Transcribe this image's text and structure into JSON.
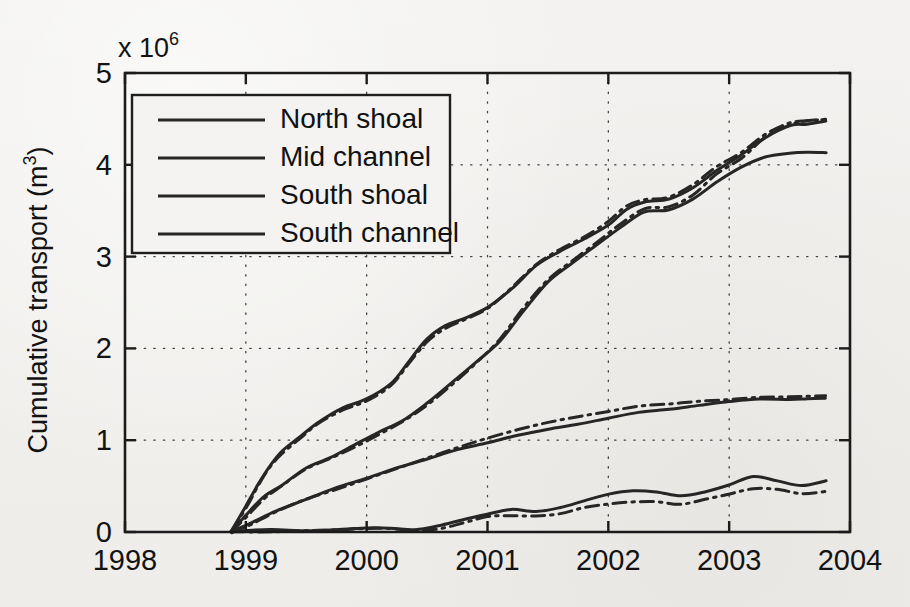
{
  "figure": {
    "kind": "scanned-line-plot",
    "background_color": "#f2f1ef",
    "ink_color": "#262626"
  },
  "chart_data": {
    "type": "line",
    "title": "",
    "xlabel": "",
    "ylabel": "Cumulative transport (m3)",
    "ylabel_base": "Cumulative transport (m",
    "ylabel_sup": "3",
    "ylabel_close": ")",
    "y_exponent_prefix": "x 10",
    "y_exponent": "6",
    "y_scale_note": "values in units of 1e6 m^3",
    "xlim": [
      1998,
      2004
    ],
    "ylim": [
      0,
      5
    ],
    "xticks": [
      1998,
      1999,
      2000,
      2001,
      2002,
      2003,
      2004
    ],
    "xticklabels": [
      "1998",
      "1999",
      "2000",
      "2001",
      "2002",
      "2003",
      "2004"
    ],
    "yticks": [
      0,
      1,
      2,
      3,
      4,
      5
    ],
    "yticklabels": [
      "0",
      "1",
      "2",
      "3",
      "4",
      "5"
    ],
    "grid": true,
    "grid_style": "dotted",
    "legend_position": "upper-left",
    "legend_entries": [
      "North shoal",
      "Mid channel",
      "South shoal",
      "South channel"
    ],
    "series": [
      {
        "name": "North shoal",
        "style": "solid",
        "x": [
          1998.88,
          1999.0,
          1999.1,
          1999.2,
          1999.3,
          1999.45,
          1999.6,
          1999.8,
          2000.0,
          2000.2,
          2000.35,
          2000.5,
          2000.65,
          2000.8,
          2001.0,
          2001.2,
          2001.4,
          2001.6,
          2001.8,
          2002.0,
          2002.15,
          2002.3,
          2002.5,
          2002.7,
          2002.9,
          2003.1,
          2003.3,
          2003.5,
          2003.65,
          2003.8
        ],
        "y": [
          0.0,
          0.28,
          0.52,
          0.72,
          0.88,
          1.05,
          1.2,
          1.35,
          1.45,
          1.62,
          1.85,
          2.1,
          2.25,
          2.32,
          2.45,
          2.65,
          2.9,
          3.05,
          3.2,
          3.35,
          3.52,
          3.6,
          3.62,
          3.75,
          3.95,
          4.1,
          4.3,
          4.42,
          4.45,
          4.47
        ]
      },
      {
        "name": "North shoal (alt run)",
        "style": "dash-dot",
        "x": [
          1998.88,
          1999.0,
          1999.1,
          1999.2,
          1999.3,
          1999.45,
          1999.6,
          1999.8,
          2000.0,
          2000.2,
          2000.35,
          2000.5,
          2000.65,
          2000.8,
          2001.0,
          2001.2,
          2001.4,
          2001.6,
          2001.8,
          2002.0,
          2002.15,
          2002.3,
          2002.5,
          2002.7,
          2002.9,
          2003.1,
          2003.3,
          2003.5,
          2003.65,
          2003.8
        ],
        "y": [
          0.0,
          0.26,
          0.5,
          0.7,
          0.86,
          1.02,
          1.18,
          1.33,
          1.43,
          1.6,
          1.83,
          2.08,
          2.22,
          2.3,
          2.44,
          2.66,
          2.92,
          3.08,
          3.22,
          3.38,
          3.55,
          3.62,
          3.64,
          3.78,
          3.98,
          4.14,
          4.33,
          4.45,
          4.48,
          4.5
        ]
      },
      {
        "name": "Mid channel",
        "style": "solid",
        "x": [
          1998.88,
          1999.0,
          1999.15,
          1999.3,
          1999.5,
          1999.7,
          1999.9,
          2000.1,
          2000.3,
          2000.5,
          2000.7,
          2000.9,
          2001.1,
          2001.3,
          2001.5,
          2001.7,
          2001.9,
          2002.1,
          2002.3,
          2002.5,
          2002.7,
          2002.9,
          2003.1,
          2003.3,
          2003.5,
          2003.65,
          2003.8
        ],
        "y": [
          0.0,
          0.18,
          0.38,
          0.52,
          0.7,
          0.82,
          0.95,
          1.08,
          1.22,
          1.4,
          1.62,
          1.85,
          2.08,
          2.4,
          2.72,
          2.92,
          3.12,
          3.32,
          3.48,
          3.5,
          3.62,
          3.82,
          3.98,
          4.08,
          4.12,
          4.13,
          4.14
        ]
      },
      {
        "name": "Mid channel (alt run)",
        "style": "dash-dot",
        "x": [
          1998.88,
          1999.0,
          1999.15,
          1999.3,
          1999.5,
          1999.7,
          1999.9,
          2000.1,
          2000.3,
          2000.5,
          2000.7,
          2000.9,
          2001.1,
          2001.3,
          2001.5,
          2001.7,
          2001.9,
          2002.1,
          2002.3,
          2002.5,
          2002.7,
          2002.9,
          2003.1,
          2003.3,
          2003.5,
          2003.65,
          2003.8
        ],
        "y": [
          0.0,
          0.16,
          0.36,
          0.5,
          0.68,
          0.8,
          0.93,
          1.06,
          1.2,
          1.38,
          1.6,
          1.84,
          2.1,
          2.44,
          2.75,
          2.95,
          3.15,
          3.35,
          3.52,
          3.55,
          3.68,
          3.9,
          4.08,
          4.3,
          4.44,
          4.48,
          4.5
        ]
      },
      {
        "name": "South shoal",
        "style": "solid",
        "x": [
          1998.88,
          1999.05,
          1999.25,
          1999.5,
          1999.75,
          2000.0,
          2000.25,
          2000.5,
          2000.75,
          2001.0,
          2001.25,
          2001.5,
          2001.75,
          2002.0,
          2002.25,
          2002.5,
          2002.75,
          2003.0,
          2003.25,
          2003.5,
          2003.65,
          2003.8
        ],
        "y": [
          0.0,
          0.1,
          0.22,
          0.36,
          0.48,
          0.58,
          0.7,
          0.8,
          0.9,
          0.98,
          1.06,
          1.12,
          1.18,
          1.24,
          1.3,
          1.34,
          1.38,
          1.42,
          1.44,
          1.45,
          1.46,
          1.46
        ]
      },
      {
        "name": "South shoal (alt run)",
        "style": "dash-dot",
        "x": [
          1998.88,
          1999.05,
          1999.25,
          1999.5,
          1999.75,
          2000.0,
          2000.25,
          2000.5,
          2000.75,
          2001.0,
          2001.25,
          2001.5,
          2001.75,
          2002.0,
          2002.25,
          2002.5,
          2002.75,
          2003.0,
          2003.25,
          2003.5,
          2003.65,
          2003.8
        ],
        "y": [
          0.0,
          0.09,
          0.21,
          0.35,
          0.47,
          0.57,
          0.69,
          0.8,
          0.92,
          1.02,
          1.12,
          1.2,
          1.26,
          1.32,
          1.37,
          1.4,
          1.42,
          1.45,
          1.47,
          1.48,
          1.48,
          1.49
        ]
      },
      {
        "name": "South channel",
        "style": "solid",
        "x": [
          1998.88,
          1999.2,
          1999.5,
          1999.8,
          2000.0,
          2000.2,
          2000.4,
          2000.6,
          2000.8,
          2001.0,
          2001.2,
          2001.4,
          2001.6,
          2001.8,
          2002.0,
          2002.2,
          2002.4,
          2002.6,
          2002.8,
          2003.0,
          2003.2,
          2003.4,
          2003.6,
          2003.8
        ],
        "y": [
          0.0,
          0.02,
          0.02,
          0.03,
          0.05,
          0.04,
          0.03,
          0.06,
          0.14,
          0.2,
          0.24,
          0.23,
          0.26,
          0.34,
          0.42,
          0.45,
          0.44,
          0.4,
          0.44,
          0.52,
          0.6,
          0.56,
          0.5,
          0.55
        ]
      },
      {
        "name": "South channel (alt run)",
        "style": "dash-dot",
        "x": [
          1998.88,
          1999.2,
          1999.5,
          1999.8,
          2000.0,
          2000.2,
          2000.4,
          2000.6,
          2000.8,
          2001.0,
          2001.2,
          2001.4,
          2001.6,
          2001.8,
          2002.0,
          2002.2,
          2002.4,
          2002.6,
          2002.8,
          2003.0,
          2003.2,
          2003.4,
          2003.6,
          2003.8
        ],
        "y": [
          0.0,
          0.01,
          0.01,
          0.02,
          0.03,
          0.03,
          0.02,
          0.04,
          0.1,
          0.16,
          0.18,
          0.17,
          0.2,
          0.26,
          0.3,
          0.33,
          0.33,
          0.31,
          0.36,
          0.42,
          0.48,
          0.46,
          0.42,
          0.45
        ]
      }
    ]
  }
}
